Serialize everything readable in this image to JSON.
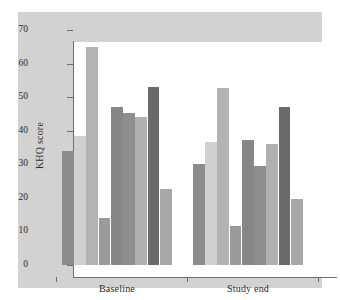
{
  "chart_data": {
    "type": "bar",
    "title": "",
    "subtitle": "",
    "xlabel": "",
    "ylabel": "KHQ score",
    "ylim": [
      0,
      70
    ],
    "yticks": [
      0,
      10,
      20,
      30,
      40,
      50,
      60,
      70
    ],
    "ytick_labels": [
      "0",
      "10",
      "20",
      "30",
      "40",
      "50",
      "60",
      "70"
    ],
    "grid": false,
    "legend": "none",
    "categories": [
      "Baseline",
      "Study end"
    ],
    "bar_count_per_group": 9,
    "series": [
      {
        "name": "Domain 1",
        "values": [
          34.0,
          30.1
        ],
        "color": "#8c8c8c"
      },
      {
        "name": "Domain 2",
        "values": [
          38.5,
          36.5
        ],
        "color": "#d0d0d0"
      },
      {
        "name": "Domain 3",
        "values": [
          64.9,
          52.8
        ],
        "color": "#b3b3b3"
      },
      {
        "name": "Domain 4",
        "values": [
          13.9,
          11.5
        ],
        "color": "#9a9a9a"
      },
      {
        "name": "Domain 5",
        "values": [
          47.0,
          37.2
        ],
        "color": "#868686"
      },
      {
        "name": "Domain 6",
        "values": [
          45.4,
          29.4
        ],
        "color": "#8e8e8e"
      },
      {
        "name": "Domain 7",
        "values": [
          44.0,
          36.0
        ],
        "color": "#b0b0b0"
      },
      {
        "name": "Domain 8",
        "values": [
          53.1,
          47.0
        ],
        "color": "#6a6a6a"
      },
      {
        "name": "Domain 9",
        "values": [
          22.7,
          19.8
        ],
        "color": "#a8a8a8"
      }
    ],
    "groups": [
      {
        "label": "Baseline",
        "values": [
          34.0,
          38.5,
          64.9,
          13.9,
          47.0,
          45.4,
          44.0,
          53.1,
          22.7
        ]
      },
      {
        "label": "Study end",
        "values": [
          30.1,
          36.5,
          52.8,
          11.5,
          37.2,
          29.4,
          36.0,
          47.0,
          19.8
        ]
      }
    ],
    "colors": {
      "figure_background": "#ffffff",
      "panel_background": "#d2d2d2",
      "plot_background": "#ffffff",
      "axis": "#6e6e6e",
      "text": "#2b2b2b"
    }
  }
}
